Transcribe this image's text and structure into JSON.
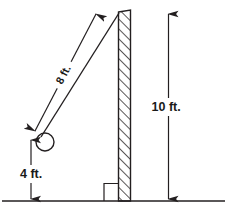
{
  "figure": {
    "background_color": "#ffffff",
    "stroke_color": "#231f20",
    "labels": {
      "ladder_length": "8 ft.",
      "wall_height": "10 ft.",
      "base_height": "4 ft."
    },
    "geometry": {
      "ground_line_y": 201,
      "wall_left_x": 118,
      "wall_right_x": 131,
      "wall_top_y": 11,
      "wall_bottom_y": 201,
      "circle_center_x": 45,
      "circle_center_y": 142,
      "circle_radius": 9,
      "ladder_top_x": 119,
      "ladder_top_y": 13,
      "ladder_bottom_x": 40,
      "ladder_bottom_y": 136,
      "ladder_dim_arrow_tip_x": 98,
      "ladder_dim_arrow_tip_y": 11,
      "ladder_dim_arrow_tail_x": 33,
      "ladder_dim_arrow_tail_y": 133,
      "height_dim_x": 168,
      "height_dim_top_y": 12,
      "height_dim_bottom_y": 200,
      "base_dim_x": 31,
      "base_dim_top_y": 138,
      "base_dim_bottom_y": 200,
      "right_angle_left_x": 104,
      "right_angle_top_y": 183
    }
  }
}
